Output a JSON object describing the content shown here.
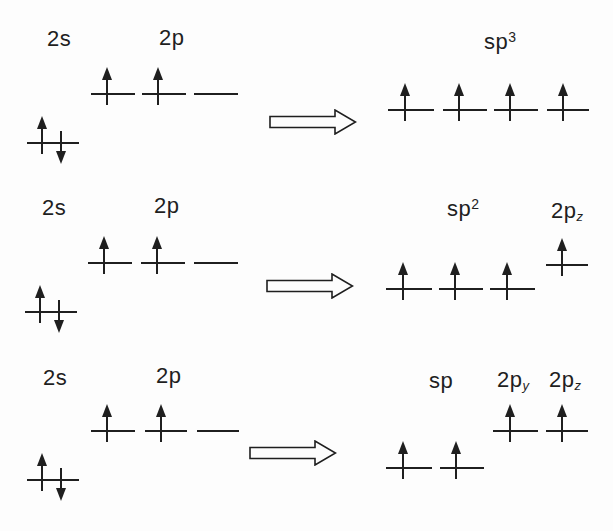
{
  "canvas": {
    "width": 613,
    "height": 531,
    "background": "#fdfdfd",
    "ink": "#1f1f1f"
  },
  "labels": {
    "r1_2s": {
      "base": "2s"
    },
    "r1_2p": {
      "base": "2p"
    },
    "r1_sp3": {
      "base": "sp",
      "sup": "3"
    },
    "r2_2s": {
      "base": "2s"
    },
    "r2_2p": {
      "base": "2p"
    },
    "r2_sp2": {
      "base": "sp",
      "sup": "2"
    },
    "r2_2pz": {
      "base": "2p",
      "sub": "z"
    },
    "r3_2s": {
      "base": "2s"
    },
    "r3_2p": {
      "base": "2p"
    },
    "r3_sp": {
      "base": "sp"
    },
    "r3_2py": {
      "base": "2p",
      "sub": "y"
    },
    "r3_2pz": {
      "base": "2p",
      "sub": "z"
    }
  },
  "diagram": {
    "rows": [
      {
        "from": [
          "2s",
          "2p"
        ],
        "to": [
          "sp3"
        ]
      },
      {
        "from": [
          "2s",
          "2p"
        ],
        "to": [
          "sp2",
          "2pz"
        ]
      },
      {
        "from": [
          "2s",
          "2p"
        ],
        "to": [
          "sp",
          "2py",
          "2pz"
        ]
      }
    ],
    "orbitals": [
      {
        "id": "row1-2s",
        "x": 27,
        "y": 143,
        "w": 52,
        "electrons": "paired"
      },
      {
        "id": "row1-2p-1",
        "x": 91,
        "y": 94,
        "w": 44,
        "electrons": "single"
      },
      {
        "id": "row1-2p-2",
        "x": 142,
        "y": 94,
        "w": 44,
        "electrons": "single"
      },
      {
        "id": "row1-2p-3",
        "x": 194,
        "y": 94,
        "w": 44,
        "electrons": "empty"
      },
      {
        "id": "row1-sp3-1",
        "x": 388,
        "y": 110,
        "w": 46,
        "electrons": "single"
      },
      {
        "id": "row1-sp3-2",
        "x": 443,
        "y": 110,
        "w": 44,
        "electrons": "single"
      },
      {
        "id": "row1-sp3-3",
        "x": 494,
        "y": 110,
        "w": 44,
        "electrons": "single"
      },
      {
        "id": "row1-sp3-4",
        "x": 547,
        "y": 110,
        "w": 42,
        "electrons": "single"
      },
      {
        "id": "row2-2s",
        "x": 25,
        "y": 312,
        "w": 52,
        "electrons": "paired"
      },
      {
        "id": "row2-2p-1",
        "x": 88,
        "y": 263,
        "w": 44,
        "electrons": "single"
      },
      {
        "id": "row2-2p-2",
        "x": 141,
        "y": 263,
        "w": 44,
        "electrons": "single"
      },
      {
        "id": "row2-2p-3",
        "x": 194,
        "y": 263,
        "w": 44,
        "electrons": "empty"
      },
      {
        "id": "row2-sp2-1",
        "x": 386,
        "y": 289,
        "w": 46,
        "electrons": "single"
      },
      {
        "id": "row2-sp2-2",
        "x": 439,
        "y": 289,
        "w": 44,
        "electrons": "single"
      },
      {
        "id": "row2-sp2-3",
        "x": 490,
        "y": 289,
        "w": 45,
        "electrons": "single"
      },
      {
        "id": "row2-2pz",
        "x": 546,
        "y": 265,
        "w": 42,
        "electrons": "single"
      },
      {
        "id": "row3-2s",
        "x": 27,
        "y": 480,
        "w": 52,
        "electrons": "paired"
      },
      {
        "id": "row3-2p-1",
        "x": 91,
        "y": 431,
        "w": 44,
        "electrons": "single"
      },
      {
        "id": "row3-2p-2",
        "x": 145,
        "y": 431,
        "w": 42,
        "electrons": "single"
      },
      {
        "id": "row3-2p-3",
        "x": 197,
        "y": 431,
        "w": 42,
        "electrons": "empty"
      },
      {
        "id": "row3-sp-1",
        "x": 386,
        "y": 468,
        "w": 46,
        "electrons": "single"
      },
      {
        "id": "row3-sp-2",
        "x": 440,
        "y": 468,
        "w": 44,
        "electrons": "single"
      },
      {
        "id": "row3-2py",
        "x": 493,
        "y": 431,
        "w": 45,
        "electrons": "single"
      },
      {
        "id": "row3-2pz",
        "x": 546,
        "y": 431,
        "w": 42,
        "electrons": "single"
      }
    ],
    "transform_arrows": [
      {
        "id": "row1",
        "x": 269,
        "y": 109
      },
      {
        "id": "row2",
        "x": 266,
        "y": 273
      },
      {
        "id": "row3",
        "x": 249,
        "y": 440
      }
    ]
  }
}
